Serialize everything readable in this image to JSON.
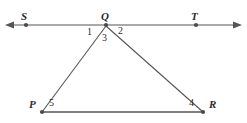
{
  "figure": {
    "background_color": "#ffffff",
    "stroke_color": "#555555",
    "label_color": "#2b2b2b",
    "width": 247,
    "height": 123
  },
  "points": {
    "S": {
      "label": "S",
      "x": 26,
      "y": 25,
      "label_x": 21,
      "label_y": 11
    },
    "Q": {
      "label": "Q",
      "x": 106,
      "y": 25,
      "label_x": 101,
      "label_y": 11
    },
    "T": {
      "label": "T",
      "x": 196,
      "y": 25,
      "label_x": 191,
      "label_y": 11
    },
    "P": {
      "label": "P",
      "x": 42,
      "y": 112,
      "label_x": 29,
      "label_y": 99
    },
    "R": {
      "label": "R",
      "x": 203,
      "y": 112,
      "label_x": 209,
      "label_y": 99
    }
  },
  "angles": [
    {
      "label": "1",
      "x": 87,
      "y": 27,
      "vertex": "Q"
    },
    {
      "label": "2",
      "x": 118,
      "y": 26,
      "vertex": "Q"
    },
    {
      "label": "3",
      "x": 102,
      "y": 33,
      "vertex": "Q"
    },
    {
      "label": "4",
      "x": 189,
      "y": 98,
      "vertex": "R"
    },
    {
      "label": "5",
      "x": 49,
      "y": 98,
      "vertex": "P"
    }
  ],
  "segments": [
    {
      "name": "line-ST",
      "from": "S-arrow-left",
      "to": "T-arrow-right",
      "x1": 10,
      "y1": 25,
      "x2": 237,
      "y2": 25,
      "arrows": "both"
    },
    {
      "name": "segment-QP",
      "from": "Q",
      "to": "P",
      "x1": 106,
      "y1": 26,
      "x2": 42,
      "y2": 112,
      "arrows": "none"
    },
    {
      "name": "segment-QR",
      "from": "Q",
      "to": "R",
      "x1": 106,
      "y1": 26,
      "x2": 203,
      "y2": 112,
      "arrows": "none"
    },
    {
      "name": "segment-PR",
      "from": "P",
      "to": "R",
      "x1": 42,
      "y1": 112,
      "x2": 203,
      "y2": 112,
      "arrows": "none"
    }
  ]
}
